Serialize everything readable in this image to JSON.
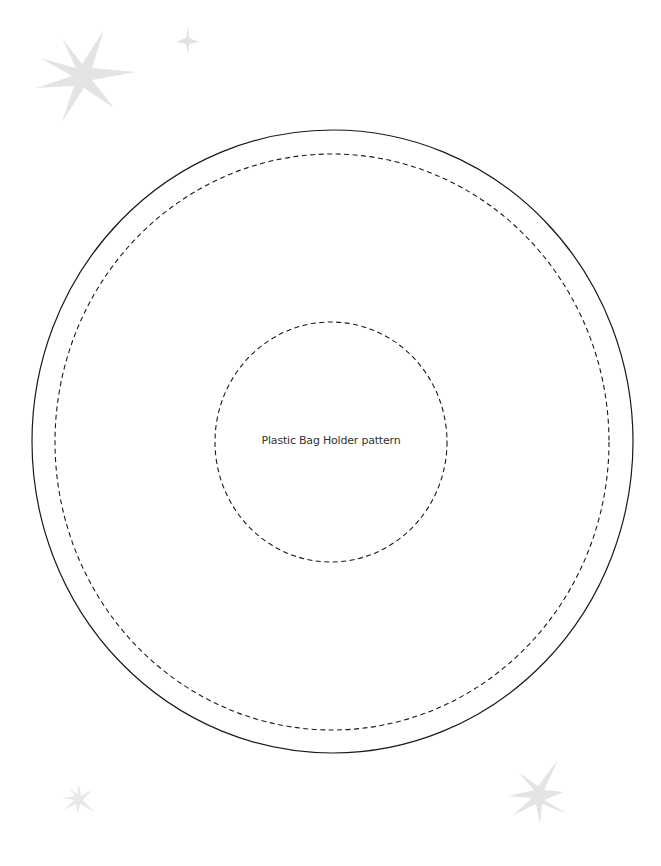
{
  "pattern": {
    "title": "Plastic Bag Holder pattern",
    "colors": {
      "background": "#ffffff",
      "line": "#1a1a1a",
      "text": "#333333",
      "sparkle": "#e2e2e2"
    },
    "circles": [
      {
        "name": "outer-cut-line",
        "style": "solid",
        "cx": 332.5,
        "cy": 441.5,
        "rx": 300.5,
        "ry": 311.5
      },
      {
        "name": "outer-stitch-line",
        "style": "dashed",
        "cx": 332,
        "cy": 442,
        "rx": 277,
        "ry": 288
      },
      {
        "name": "inner-stitch-line",
        "style": "dashed",
        "cx": 331,
        "cy": 442,
        "rx": 116,
        "ry": 120
      }
    ]
  },
  "decorations": {
    "sparkles": [
      {
        "name": "sparkle-large-top-left",
        "x": 85,
        "y": 78,
        "size": 55
      },
      {
        "name": "sparkle-small-top",
        "x": 187,
        "y": 41,
        "size": 13
      },
      {
        "name": "sparkle-bottom-right",
        "x": 537,
        "y": 797,
        "size": 32
      },
      {
        "name": "sparkle-bottom-left",
        "x": 78,
        "y": 800,
        "size": 17
      }
    ]
  }
}
